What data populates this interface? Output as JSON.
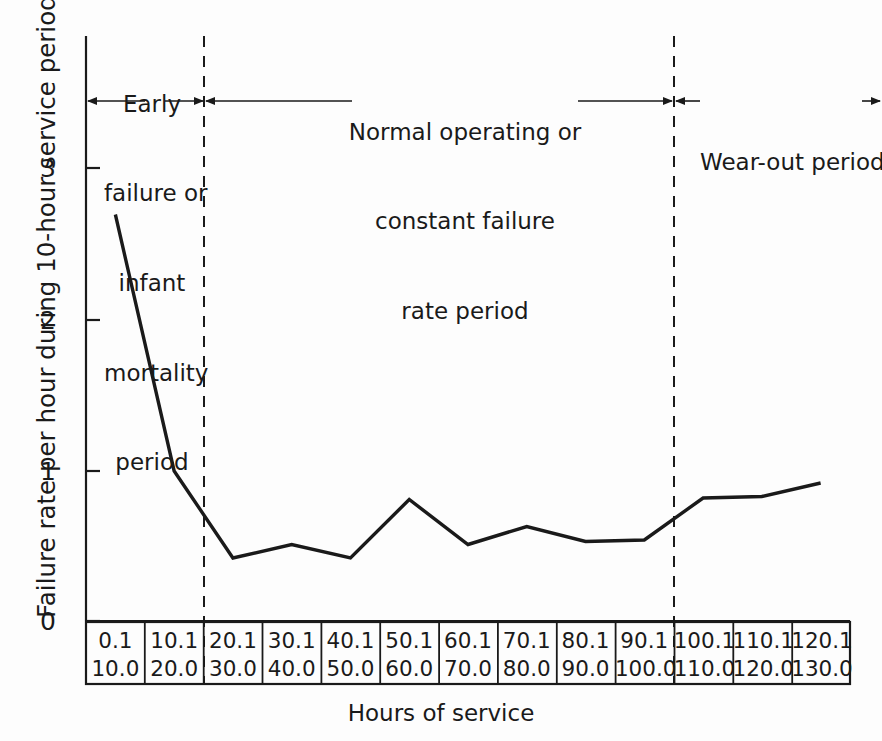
{
  "figure": {
    "title": "",
    "background_color": "#fdfdfd",
    "ink_color": "#1a1a1a"
  },
  "axes": {
    "ylabel": "Failure rate per hour during 10-hour service periods",
    "xlabel": "Hours of service",
    "ytick_labels": [
      "0",
      "1",
      "2",
      "3"
    ],
    "ylim": [
      0,
      3.5
    ],
    "grid": false
  },
  "phases": [
    {
      "id": "infant-mortality",
      "lines": [
        "Early",
        "failure or",
        "infant",
        "mortality",
        "period"
      ],
      "arrow_line_index": 2
    },
    {
      "id": "constant-failure",
      "lines": [
        "Normal operating or",
        "constant failure",
        "rate period"
      ],
      "arrow_line_index": 1
    },
    {
      "id": "wear-out",
      "lines": [
        "Wear-out period"
      ],
      "arrow_line_index": 0
    }
  ],
  "xtable": {
    "top_labels": [
      "0.1",
      "10.1",
      "20.1",
      "30.1",
      "40.1",
      "50.1",
      "60.1",
      "70.1",
      "80.1",
      "90.1",
      "100.1",
      "110.1",
      "120.1"
    ],
    "bottom_labels": [
      "10.0",
      "20.0",
      "30.0",
      "40.0",
      "50.0",
      "60.0",
      "70.0",
      "80.0",
      "90.0",
      "100.0",
      "110.0",
      "120.0",
      "130.0"
    ]
  },
  "chart_data": {
    "type": "line",
    "title": "",
    "xlabel": "Hours of service",
    "ylabel": "Failure rate per hour during 10-hour service periods",
    "categories": [
      "0.1-10.0",
      "10.1-20.0",
      "20.1-30.0",
      "30.1-40.0",
      "40.1-50.0",
      "50.1-60.0",
      "60.1-70.0",
      "70.1-80.0",
      "80.1-90.0",
      "90.1-100.0",
      "100.1-110.0",
      "110.1-120.0",
      "120.1-130.0"
    ],
    "values": [
      2.71,
      1.0,
      0.42,
      0.51,
      0.42,
      0.81,
      0.51,
      0.63,
      0.53,
      0.54,
      0.82,
      0.83,
      0.92
    ],
    "ylim": [
      0,
      3.5
    ],
    "yticks": [
      0,
      1,
      2,
      3
    ],
    "grid": false,
    "legend": null,
    "annotations": [
      {
        "text": "Early failure or infant mortality period",
        "span_categories": [
          "0.1-10.0",
          "10.1-20.0"
        ]
      },
      {
        "text": "Normal operating or constant failure rate period",
        "span_categories": [
          "20.1-30.0",
          "90.1-100.0"
        ]
      },
      {
        "text": "Wear-out period",
        "span_categories": [
          "100.1-110.0",
          "120.1-130.0"
        ]
      }
    ],
    "phase_boundaries": [
      "20.1-30.0",
      "100.1-110.0"
    ]
  }
}
